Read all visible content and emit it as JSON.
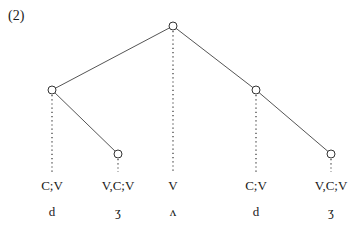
{
  "example_number": "(2)",
  "tree": {
    "nodes": [
      {
        "id": "root",
        "x": 173,
        "y": 26
      },
      {
        "id": "left",
        "x": 52,
        "y": 90
      },
      {
        "id": "left-leaf",
        "x": 118,
        "y": 154
      },
      {
        "id": "right",
        "x": 256,
        "y": 90
      },
      {
        "id": "right-leaf",
        "x": 331,
        "y": 154
      }
    ]
  },
  "columns": [
    {
      "feature": "C;V",
      "segment": "d",
      "x": 52
    },
    {
      "feature": "V,C;V",
      "segment": "ʒ",
      "x": 118
    },
    {
      "feature": "V",
      "segment": "ʌ",
      "x": 173
    },
    {
      "feature": "C;V",
      "segment": "d",
      "x": 256
    },
    {
      "feature": "V,C;V",
      "segment": "ʒ",
      "x": 331
    }
  ]
}
